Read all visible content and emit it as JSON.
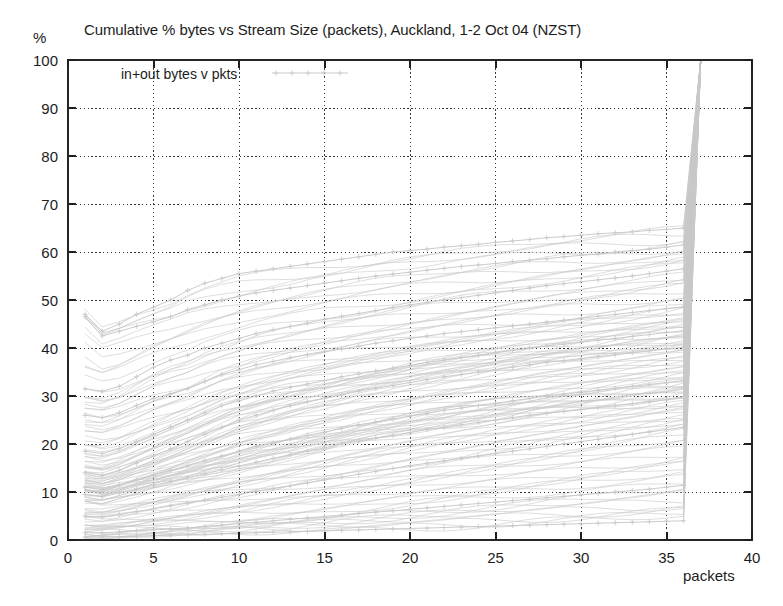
{
  "chart_data": {
    "type": "line",
    "title": "Cumulative % bytes vs Stream Size (packets), Auckland, 1-2 Oct 04 (NZST)",
    "xlabel": "packets",
    "ylabel": "%",
    "xlim": [
      0,
      40
    ],
    "ylim": [
      0,
      100
    ],
    "xticks": [
      0,
      5,
      10,
      15,
      20,
      25,
      30,
      35,
      40
    ],
    "yticks": [
      0,
      10,
      20,
      30,
      40,
      50,
      60,
      70,
      80,
      90,
      100
    ],
    "grid": true,
    "grid_style": "dotted",
    "legend": {
      "position": "top-left-inside",
      "entries": [
        {
          "label": "in+out bytes v pkts",
          "color": "#c9c9c9",
          "marker": "+"
        }
      ]
    },
    "series_count": 96,
    "series_color": "#c8c8c8",
    "marker": "+",
    "x": [
      1,
      2,
      3,
      4,
      5,
      6,
      7,
      8,
      9,
      10,
      11,
      12,
      13,
      14,
      15,
      16,
      17,
      18,
      19,
      20,
      21,
      22,
      23,
      24,
      25,
      26,
      27,
      28,
      29,
      30,
      31,
      32,
      33,
      34,
      35,
      36,
      37
    ],
    "series": [
      {
        "name": "trace-high-1",
        "values": [
          47,
          43.5,
          45,
          47,
          48.5,
          50,
          52,
          53.5,
          54.5,
          55.5,
          56,
          56.5,
          57,
          57.5,
          58,
          58.5,
          59,
          59.5,
          60,
          60.3,
          60.6,
          61,
          61.3,
          61.6,
          62,
          62.3,
          62.6,
          63,
          63.2,
          63.5,
          63.8,
          64,
          64.2,
          64.5,
          64.7,
          65,
          100
        ]
      },
      {
        "name": "trace-high-2",
        "values": [
          46.5,
          42.5,
          43.5,
          44.5,
          45.5,
          46.5,
          48,
          49,
          50,
          50.8,
          51.5,
          52,
          52.5,
          53,
          53.5,
          54,
          54.5,
          55,
          55.4,
          55.8,
          56.2,
          56.6,
          57,
          57.3,
          57.6,
          58,
          58.3,
          58.6,
          59,
          59.3,
          59.6,
          60,
          60.3,
          60.6,
          61,
          61.5,
          100
        ]
      },
      {
        "name": "trace-mid-1",
        "values": [
          31.5,
          31,
          32,
          34,
          36,
          37.5,
          38.5,
          40,
          41,
          42,
          43,
          43.8,
          44.5,
          45.2,
          46,
          46.6,
          47.2,
          47.8,
          48.4,
          49,
          49.5,
          50,
          50.5,
          51,
          51.5,
          52,
          52.5,
          53,
          53.4,
          53.8,
          54.2,
          54.6,
          55,
          55.5,
          56,
          56.5,
          100
        ]
      },
      {
        "name": "trace-mid-2",
        "values": [
          26,
          25.5,
          26.5,
          28,
          29.5,
          30.5,
          31.5,
          33,
          34.5,
          35.5,
          36.5,
          37.2,
          38,
          38.6,
          39.2,
          39.8,
          40.4,
          41,
          41.5,
          42,
          42.5,
          43,
          43.4,
          43.8,
          44.2,
          44.6,
          45,
          45.4,
          45.8,
          46.2,
          46.6,
          47,
          47.4,
          47.8,
          48.2,
          48.6,
          100
        ]
      },
      {
        "name": "trace-mid-3",
        "values": [
          18.5,
          18,
          19,
          20.5,
          22,
          23.5,
          25,
          26.5,
          28,
          29,
          30,
          31,
          31.8,
          32.5,
          33.2,
          34,
          34.6,
          35.2,
          35.8,
          36.4,
          37,
          37.5,
          38,
          38.5,
          39,
          39.5,
          40,
          40.4,
          40.8,
          41.2,
          41.6,
          42,
          42.4,
          42.8,
          43.2,
          43.6,
          100
        ]
      },
      {
        "name": "trace-mid-4",
        "values": [
          14,
          13.5,
          14.5,
          16,
          17.5,
          19,
          20.5,
          22,
          23.5,
          25,
          26,
          27,
          28,
          28.8,
          29.5,
          30.2,
          31,
          31.6,
          32.2,
          32.8,
          33.4,
          34,
          34.5,
          35,
          35.5,
          36,
          36.5,
          37,
          37.4,
          37.8,
          38.2,
          38.6,
          39,
          39.4,
          39.8,
          40.2,
          100
        ]
      },
      {
        "name": "trace-low-1",
        "values": [
          11,
          10.5,
          11.5,
          12.5,
          13.5,
          14.5,
          15.5,
          16.5,
          17.5,
          18.5,
          19.5,
          20.2,
          21,
          21.8,
          22.5,
          23.2,
          24,
          24.6,
          25.2,
          25.8,
          26.4,
          27,
          27.5,
          28,
          28.5,
          29,
          29.5,
          30,
          30.4,
          30.8,
          31.2,
          31.6,
          32,
          32.4,
          32.8,
          33.2,
          100
        ]
      },
      {
        "name": "trace-low-2",
        "values": [
          9.5,
          9,
          9.8,
          10.6,
          11.4,
          12.2,
          13,
          13.8,
          14.6,
          15.4,
          16.2,
          17,
          17.8,
          18.5,
          19.2,
          20,
          20.6,
          21.2,
          21.8,
          22.4,
          23,
          23.5,
          24,
          24.5,
          25,
          25.5,
          26,
          26.4,
          26.8,
          27.2,
          27.6,
          28,
          28.4,
          28.8,
          29.2,
          29.6,
          100
        ]
      },
      {
        "name": "trace-low-3",
        "values": [
          5,
          4.8,
          5.3,
          5.9,
          6.5,
          7.1,
          7.7,
          8.3,
          8.9,
          9.5,
          10.1,
          10.7,
          11.3,
          11.9,
          12.5,
          13.1,
          13.7,
          14.3,
          14.9,
          15.5,
          16,
          16.5,
          17,
          17.5,
          18,
          18.5,
          19,
          19.5,
          20,
          20.5,
          21,
          21.5,
          22,
          22.5,
          23,
          23.5,
          100
        ]
      },
      {
        "name": "trace-low-4",
        "values": [
          1.5,
          1.5,
          1.7,
          1.9,
          2.1,
          2.3,
          2.5,
          2.8,
          3.1,
          3.4,
          3.7,
          4,
          4.3,
          4.6,
          4.9,
          5.2,
          5.5,
          5.8,
          6.1,
          6.4,
          6.7,
          7,
          7.3,
          7.6,
          7.9,
          8.2,
          8.5,
          8.8,
          9.1,
          9.4,
          9.7,
          10,
          10.3,
          10.6,
          11,
          11.4,
          100
        ]
      },
      {
        "name": "trace-low-5",
        "values": [
          0.6,
          0.6,
          0.7,
          0.8,
          0.9,
          1,
          1.1,
          1.2,
          1.3,
          1.4,
          1.5,
          1.6,
          1.7,
          1.8,
          1.9,
          2,
          2.1,
          2.2,
          2.3,
          2.4,
          2.5,
          2.6,
          2.7,
          2.8,
          2.9,
          3,
          3.1,
          3.2,
          3.3,
          3.4,
          3.5,
          3.6,
          3.7,
          3.8,
          3.9,
          4,
          100
        ]
      }
    ]
  },
  "plot_geometry": {
    "left": 68,
    "right": 752,
    "top": 60,
    "bottom": 540
  }
}
